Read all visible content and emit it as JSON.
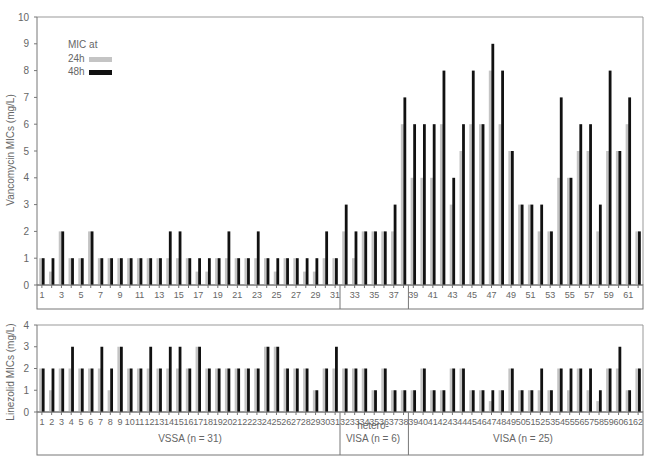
{
  "chart_data": [
    {
      "type": "bar",
      "title": "",
      "ylabel": "Vancomycin MICs (mg/L)",
      "xlabel": "",
      "ylim": [
        0,
        10
      ],
      "yticks": [
        0,
        1,
        2,
        3,
        4,
        5,
        6,
        7,
        8,
        9,
        10
      ],
      "xtick_labels": [
        "1",
        "3",
        "5",
        "7",
        "9",
        "11",
        "13",
        "15",
        "17",
        "19",
        "21",
        "23",
        "25",
        "27",
        "29",
        "31",
        "33",
        "35",
        "37",
        "39",
        "41",
        "43",
        "45",
        "47",
        "49",
        "51",
        "53",
        "55",
        "57",
        "59",
        "61"
      ],
      "legend": {
        "title": "MIC at",
        "entries": [
          {
            "label": "24h",
            "color": "#c8c8c8"
          },
          {
            "label": "48h",
            "color": "#111111"
          }
        ],
        "position": "upper-left"
      },
      "categories": [
        1,
        2,
        3,
        4,
        5,
        6,
        7,
        8,
        9,
        10,
        11,
        12,
        13,
        14,
        15,
        16,
        17,
        18,
        19,
        20,
        21,
        22,
        23,
        24,
        25,
        26,
        27,
        28,
        29,
        30,
        31,
        32,
        33,
        34,
        35,
        36,
        37,
        38,
        39,
        40,
        41,
        42,
        43,
        44,
        45,
        46,
        47,
        48,
        49,
        50,
        51,
        52,
        53,
        54,
        55,
        56,
        57,
        58,
        59,
        60,
        61,
        62
      ],
      "series": [
        {
          "name": "24h",
          "values": [
            1,
            0.5,
            2,
            1,
            1,
            2,
            1,
            1,
            1,
            1,
            1,
            1,
            1,
            1,
            1,
            1,
            0.5,
            0.5,
            1,
            1,
            1,
            1,
            1,
            1,
            0.5,
            1,
            1,
            0.5,
            0.5,
            1,
            1,
            2,
            1,
            2,
            2,
            2,
            2,
            6,
            4,
            4,
            4,
            6,
            3,
            5,
            6,
            6,
            8,
            6,
            5,
            3,
            3,
            2,
            2,
            4,
            4,
            5,
            5,
            2,
            5,
            5,
            6,
            2
          ]
        },
        {
          "name": "48h",
          "values": [
            1,
            1,
            2,
            1,
            1,
            2,
            1,
            1,
            1,
            1,
            1,
            1,
            1,
            2,
            2,
            1,
            1,
            1,
            1,
            2,
            1,
            1,
            2,
            1,
            1,
            1,
            1,
            1,
            1,
            2,
            1,
            3,
            2,
            2,
            2,
            2,
            3,
            7,
            6,
            6,
            6,
            8,
            4,
            6,
            8,
            6,
            9,
            8,
            5,
            3,
            3,
            3,
            2,
            7,
            4,
            6,
            6,
            3,
            8,
            5,
            7,
            2
          ]
        }
      ],
      "group_dividers_after": [
        31,
        38
      ]
    },
    {
      "type": "bar",
      "title": "",
      "ylabel": "Linezolid MICs (mg/L)",
      "xlabel": "",
      "ylim": [
        0,
        4
      ],
      "yticks": [
        0,
        1,
        2,
        3,
        4
      ],
      "categories": [
        1,
        2,
        3,
        4,
        5,
        6,
        7,
        8,
        9,
        10,
        11,
        12,
        13,
        14,
        15,
        16,
        17,
        18,
        19,
        20,
        21,
        22,
        23,
        24,
        25,
        26,
        27,
        28,
        29,
        30,
        31,
        32,
        33,
        34,
        35,
        36,
        37,
        38,
        39,
        40,
        41,
        42,
        43,
        44,
        45,
        46,
        47,
        48,
        49,
        50,
        51,
        52,
        53,
        54,
        55,
        56,
        57,
        58,
        59,
        60,
        61,
        62
      ],
      "series": [
        {
          "name": "24h",
          "values": [
            2,
            1,
            2,
            2,
            2,
            2,
            2,
            1,
            3,
            2,
            2,
            2,
            2,
            2,
            2,
            2,
            3,
            2,
            2,
            2,
            2,
            2,
            2,
            3,
            3,
            2,
            2,
            2,
            1,
            2,
            2,
            2,
            2,
            2,
            1,
            2,
            1,
            1,
            1,
            2,
            1,
            1,
            2,
            2,
            1,
            1,
            0.5,
            1,
            2,
            1,
            1,
            1,
            1,
            2,
            1,
            2,
            1,
            0.5,
            2,
            2,
            1,
            2
          ]
        },
        {
          "name": "48h",
          "values": [
            2,
            2,
            2,
            3,
            2,
            2,
            3,
            2,
            3,
            2,
            2,
            3,
            2,
            3,
            3,
            2,
            3,
            2,
            2,
            2,
            2,
            2,
            2,
            3,
            3,
            2,
            2,
            2,
            1,
            2,
            3,
            2,
            2,
            2,
            1,
            2,
            1,
            1,
            1,
            2,
            1,
            1,
            2,
            2,
            1,
            1,
            1,
            1,
            2,
            1,
            1,
            2,
            1,
            2,
            2,
            2,
            2,
            1,
            2,
            3,
            1,
            2
          ]
        }
      ],
      "groups": [
        {
          "label": "VSSA (n = 31)",
          "from": 1,
          "to": 31
        },
        {
          "label": "hetero-\nVISA (n = 6)",
          "from": 32,
          "to": 38
        },
        {
          "label": "VISA (n = 25)",
          "from": 39,
          "to": 62
        }
      ]
    }
  ],
  "legend": {
    "title": "MIC at",
    "label_24h": "24h",
    "label_48h": "48h"
  },
  "groups": {
    "vssa": "VSSA (n = 31)",
    "hetero_line1": "hetero-",
    "hetero_line2": "VISA (n = 6)",
    "visa": "VISA (n = 25)"
  },
  "colors": {
    "h24": "#c4c4c4",
    "h48": "#111111",
    "axis": "#777777"
  }
}
